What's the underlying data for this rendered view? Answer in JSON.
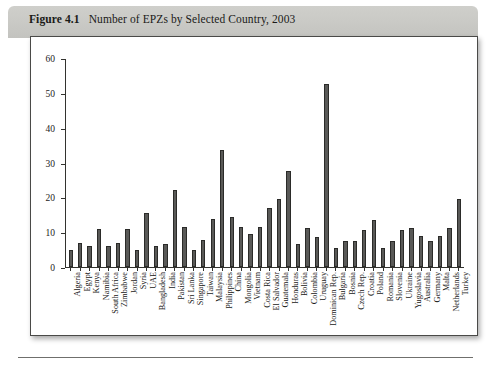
{
  "figure": {
    "number": "Figure 4.1",
    "caption": "Number of EPZs by Selected Country, 2003"
  },
  "chart_data": {
    "type": "bar",
    "title": "Number of EPZs by Selected Country, 2003",
    "xlabel": "",
    "ylabel": "",
    "ylim": [
      0,
      60
    ],
    "yticks": [
      0,
      10,
      20,
      30,
      40,
      50,
      60
    ],
    "grid": false,
    "legend": "none",
    "orientation": "vertical",
    "categories": [
      "Algeria",
      "Egypt",
      "Kenya",
      "Namibia",
      "South Africa",
      "Zimbabwe",
      "Jordan",
      "Syria",
      "UAE",
      "Bangladesh",
      "India",
      "Pakistan",
      "Sri Lanka",
      "Singapore",
      "Taiwan",
      "Malaysia",
      "Philippines",
      "China",
      "Mongolia",
      "Vietnam",
      "Costa Rica",
      "El Salvador",
      "Guatemala",
      "Honduras",
      "Bolivia",
      "Colombia",
      "Uruguay",
      "Dominican Rep.",
      "Bulgaria",
      "Bosnia",
      "Czech Rep.",
      "Croatia",
      "Poland",
      "Romania",
      "Slovenia",
      "Ukraine",
      "Yugoslavia",
      "Australia",
      "Germany",
      "Malta",
      "Netherlands",
      "Turkey"
    ],
    "values": [
      5,
      6.8,
      6,
      11,
      6,
      6.8,
      11,
      5,
      15.5,
      6,
      6.6,
      22,
      11.5,
      5,
      7.8,
      13.8,
      33.5,
      14.5,
      11.5,
      9.5,
      11.5,
      16.8,
      19.5,
      27.5,
      6.5,
      11.3,
      8.5,
      52.5,
      5.5,
      7.5,
      7.5,
      10.5,
      13.5,
      5.5,
      7.5,
      10.5,
      11.3,
      9,
      7.5,
      9,
      11.3,
      19.5
    ]
  },
  "colors": {
    "bar_fill": "#595957",
    "bar_edge": "#2b2b29",
    "axis": "#33332f",
    "header_band": "#c9c9c5",
    "frame_border": "#4a4a48",
    "page_background": "#ffffff"
  }
}
